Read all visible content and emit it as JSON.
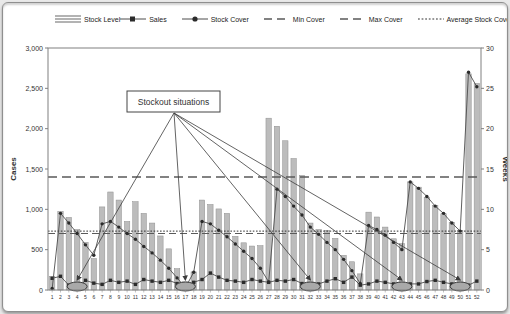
{
  "colors": {
    "bar_fill": "#bcbcbc",
    "bar_edge": "#8f8f8f",
    "line": "#4d4d4d",
    "marker": "#2b2b2b",
    "dash_line": "#5a5a5a",
    "dot_line": "#333333",
    "plot_border": "#808080",
    "ellipse_fill": "#a9a9a9",
    "ellipse_edge": "#3c3c3c"
  },
  "legend": {
    "items": [
      {
        "label": "Stock Level",
        "swatch": "bars"
      },
      {
        "label": "Sales",
        "swatch": "line-square"
      },
      {
        "label": "Stock Cover",
        "swatch": "line-circle"
      },
      {
        "label": "Min Cover",
        "swatch": "dash"
      },
      {
        "label": "Max Cover",
        "swatch": "dash"
      },
      {
        "label": "Average Stock Cover",
        "swatch": "dots"
      }
    ]
  },
  "chart_data": {
    "type": "bar",
    "subtype": "combo-bar-line",
    "categories": [
      1,
      2,
      3,
      4,
      5,
      6,
      7,
      8,
      9,
      10,
      11,
      12,
      13,
      14,
      15,
      16,
      17,
      18,
      19,
      20,
      21,
      22,
      23,
      24,
      25,
      26,
      27,
      28,
      29,
      30,
      31,
      32,
      33,
      34,
      35,
      36,
      37,
      38,
      39,
      40,
      41,
      42,
      43,
      44,
      45,
      46,
      47,
      48,
      49,
      50,
      51,
      52
    ],
    "y_left": {
      "title": "Cases",
      "min": 0,
      "max": 3000,
      "step": 500
    },
    "y_right": {
      "title": "Weeks",
      "min": 0,
      "max": 30,
      "step": 5
    },
    "grid": "off",
    "legend_position": "top",
    "series": [
      {
        "name": "Stock Level",
        "type": "bar",
        "axis": "left",
        "values": [
          170,
          975,
          900,
          750,
          590,
          390,
          1030,
          1215,
          1115,
          850,
          1095,
          950,
          830,
          670,
          510,
          265,
          100,
          225,
          1115,
          1060,
          1005,
          950,
          665,
          585,
          545,
          550,
          2130,
          2030,
          1850,
          1630,
          1420,
          830,
          750,
          740,
          640,
          430,
          350,
          200,
          965,
          905,
          780,
          635,
          575,
          1340,
          1275,
          1150,
          1050,
          945,
          840,
          740,
          2680,
          2560
        ]
      },
      {
        "name": "Sales",
        "type": "line",
        "marker": "square",
        "axis": "left",
        "values": [
          145,
          170,
          60,
          15,
          120,
          85,
          70,
          120,
          95,
          110,
          70,
          130,
          110,
          95,
          120,
          80,
          10,
          95,
          130,
          210,
          160,
          120,
          110,
          95,
          130,
          110,
          95,
          120,
          110,
          130,
          80,
          10,
          75,
          110,
          140,
          95,
          160,
          60,
          75,
          110,
          95,
          75,
          10,
          75,
          75,
          105,
          120,
          95,
          75,
          15,
          60,
          110
        ]
      },
      {
        "name": "Stock Cover",
        "type": "line",
        "marker": "circle",
        "axis": "right",
        "values": [
          0.2,
          9.5,
          8.3,
          7.0,
          5.6,
          4.3,
          8.2,
          8.5,
          7.8,
          7.0,
          6.3,
          5.4,
          4.6,
          3.7,
          2.7,
          1.5,
          0.3,
          2.2,
          8.5,
          8.2,
          7.4,
          6.6,
          5.7,
          4.8,
          3.9,
          2.7,
          1.0,
          12.5,
          11.6,
          10.4,
          9.3,
          7.8,
          6.9,
          5.9,
          5.0,
          3.8,
          2.4,
          0.8,
          8.0,
          7.5,
          6.8,
          5.9,
          5.0,
          13.4,
          12.6,
          11.6,
          10.4,
          9.5,
          8.3,
          7.3,
          27.0,
          25.2
        ]
      },
      {
        "name": "Min Cover",
        "type": "hline",
        "style": "dashed",
        "axis": "right",
        "value": 7.0
      },
      {
        "name": "Max Cover",
        "type": "hline",
        "style": "dashed",
        "axis": "right",
        "value": 14.0
      },
      {
        "name": "Average Stock Cover",
        "type": "hline",
        "style": "dotted",
        "axis": "right",
        "value": 7.3
      }
    ],
    "annotation": {
      "label": "Stockout situations",
      "stockout_weeks": [
        4,
        17,
        32,
        43,
        50
      ]
    }
  }
}
